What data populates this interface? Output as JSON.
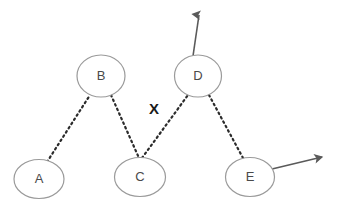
{
  "canvas": {
    "width": 340,
    "height": 211,
    "background_color": "#ffffff"
  },
  "style": {
    "node_stroke_color": "#9a9a9a",
    "node_fill_color": "#ffffff",
    "node_stroke_width": 1.2,
    "node_label_color": "#4a4a4a",
    "edge_color": "#2b2b2b",
    "edge_dot_pattern": "1.6 3.4",
    "edge_width": 2.2,
    "arrow_color": "#5a5a5a",
    "arrow_width": 1.6,
    "x_marker_color": "#1a1a1a"
  },
  "diagram": {
    "type": "node-link-graph",
    "nodes": [
      {
        "id": "A",
        "label": "A",
        "cx": 39,
        "cy": 179,
        "rx": 25,
        "ry": 19.5
      },
      {
        "id": "B",
        "label": "B",
        "cx": 101,
        "cy": 76,
        "rx": 24,
        "ry": 21
      },
      {
        "id": "C",
        "label": "C",
        "cx": 140,
        "cy": 177,
        "rx": 25.5,
        "ry": 19.5
      },
      {
        "id": "D",
        "label": "D",
        "cx": 198,
        "cy": 76,
        "rx": 23.5,
        "ry": 21
      },
      {
        "id": "E",
        "label": "E",
        "cx": 250,
        "cy": 177,
        "rx": 24.5,
        "ry": 19.5
      }
    ],
    "edges": [
      {
        "id": "edge-a-b",
        "from": "A",
        "to": "B",
        "style": "dotted",
        "x1": 47,
        "y1": 162,
        "x2": 90,
        "y2": 95
      },
      {
        "id": "edge-b-c",
        "from": "B",
        "to": "C",
        "style": "dotted",
        "x1": 111,
        "y1": 95,
        "x2": 139,
        "y2": 158
      },
      {
        "id": "edge-c-d",
        "from": "C",
        "to": "D",
        "style": "dotted",
        "x1": 142,
        "y1": 158,
        "x2": 188,
        "y2": 95
      },
      {
        "id": "edge-d-e",
        "from": "D",
        "to": "E",
        "style": "dotted",
        "x1": 209,
        "y1": 95,
        "x2": 243,
        "y2": 158
      }
    ],
    "arrows": [
      {
        "id": "arrow-from-d-up",
        "from": "D",
        "direction": "up",
        "x1": 193,
        "y1": 56,
        "x2": 199,
        "y2": 15
      },
      {
        "id": "arrow-from-e-right",
        "from": "E",
        "direction": "right",
        "x1": 272,
        "y1": 169,
        "x2": 322,
        "y2": 157
      }
    ],
    "markers": [
      {
        "id": "x-marker",
        "label": "X",
        "x": 154,
        "y": 110,
        "meaning": "crossing-point-marker"
      }
    ]
  }
}
